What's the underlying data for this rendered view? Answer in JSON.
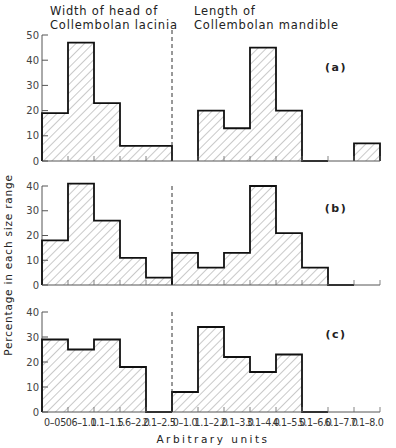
{
  "chart_data": {
    "type": "bar",
    "subtype": "histogram",
    "ylabel": "Percentage in each size range",
    "xlabel": "Arbitrary units",
    "headings": {
      "left": [
        "Width of head of",
        "Collembolan lacinia"
      ],
      "right": [
        "Length of",
        "Collembolan mandible"
      ]
    },
    "left_categories": [
      "0-0.5",
      "0.6-1.0",
      "1.1-1.5",
      "1.6-2.0",
      "2.1-2.5"
    ],
    "right_categories": [
      "0-1.0",
      "1.1-2.0",
      "2.1-3.0",
      "3.1-4.0",
      "4.1-5.0",
      "5.1-6.0",
      "6.1-7.0",
      "7.1-8.0"
    ],
    "x_tick_labels": [
      "0–0.5",
      "0.6–1.0",
      "1.1–1.5",
      "1.6–2.0",
      "2.1–2.5",
      "0–1.0",
      "1.1–2.0",
      "2.1–3.0",
      "3.1–4.0",
      "4.1–5.0",
      "5.1–6.0",
      "6.1–7.0",
      "7.1–8.0"
    ],
    "panels": [
      {
        "label": "(a)",
        "ylim": [
          0,
          50
        ],
        "yticks": [
          0,
          10,
          20,
          30,
          40,
          50
        ],
        "series": [
          {
            "name": "Width of head of Collembolan lacinia",
            "values": [
              19,
              47,
              23,
              6,
              6
            ]
          },
          {
            "name": "Length of Collembolan mandible",
            "values": [
              0,
              20,
              13,
              45,
              20,
              0,
              0,
              7
            ]
          }
        ]
      },
      {
        "label": "(b)",
        "ylim": [
          0,
          40
        ],
        "yticks": [
          0,
          10,
          20,
          30,
          40
        ],
        "series": [
          {
            "name": "Width of head of Collembolan lacinia",
            "values": [
              18,
              41,
              26,
              11,
              3
            ]
          },
          {
            "name": "Length of Collembolan mandible",
            "values": [
              13,
              7,
              13,
              40,
              21,
              7,
              0,
              0
            ]
          }
        ]
      },
      {
        "label": "(c)",
        "ylim": [
          0,
          40
        ],
        "yticks": [
          0,
          10,
          20,
          30,
          40
        ],
        "series": [
          {
            "name": "Width of head of Collembolan lacinia",
            "values": [
              29,
              25,
              29,
              18,
              0
            ]
          },
          {
            "name": "Length of Collembolan mandible",
            "values": [
              8,
              34,
              22,
              16,
              23,
              0,
              0,
              0
            ]
          }
        ]
      }
    ],
    "grid": false,
    "fill": "diagonal hatch",
    "divider": "dashed vertical line between the two distributions"
  }
}
